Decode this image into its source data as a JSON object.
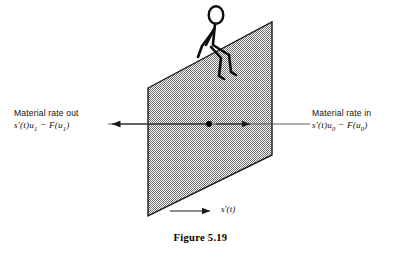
{
  "figure": {
    "caption": "Figure 5.19",
    "background_color": "#ffffff",
    "ink_color": "#111111"
  },
  "plane": {
    "name": "material-plane",
    "shape": "parallelogram",
    "fill_color": "#9a9a9a",
    "fill_style": "50% checkerboard dither",
    "stroke_color": "#1a1a1a",
    "corners": [
      [
        148,
        88
      ],
      [
        272,
        22
      ],
      [
        272,
        155
      ],
      [
        148,
        216
      ]
    ]
  },
  "center_point": {
    "x": 209,
    "y": 124,
    "color": "#000000"
  },
  "left_label": {
    "title": "Material rate out",
    "formula_prefix": "s′(t)u",
    "formula_sub1": "1",
    "formula_middle": " − F(u",
    "formula_sub2": "1",
    "formula_suffix": ")"
  },
  "right_label": {
    "title": "Material rate in",
    "formula_prefix": "s′(t)u",
    "formula_sub1": "0",
    "formula_middle": " − F(u",
    "formula_sub2": "0",
    "formula_suffix": ")"
  },
  "bottom_arrow": {
    "label": "s′(t)",
    "direction": "right",
    "from_x": 170,
    "to_x": 216,
    "y": 211
  },
  "arrows": {
    "out_arrow": {
      "direction": "left",
      "tip_x": 103,
      "tail_x": 208,
      "y": 124
    },
    "in_arrow": {
      "direction": "left",
      "tip_x": 214,
      "tail_x": 310,
      "y": 124
    }
  },
  "stick_figure": {
    "name": "seated-person",
    "head_center": [
      216,
      15
    ],
    "head_rx": 7.5,
    "head_ry": 9,
    "stroke_color": "#0d0d0d"
  }
}
